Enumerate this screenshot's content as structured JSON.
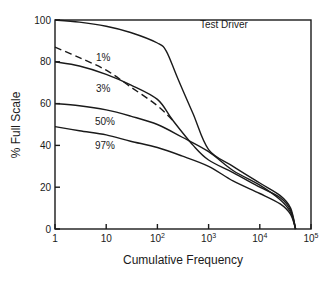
{
  "chart_data": {
    "type": "line",
    "title": "",
    "xlabel": "Cumulative Frequency",
    "ylabel": "% Full Scale",
    "xscale": "log",
    "xlim": [
      1,
      100000
    ],
    "ylim": [
      0,
      100
    ],
    "grid": false,
    "legend": "inline labels",
    "x_ticks": [
      {
        "value": 1,
        "label": "1",
        "sup": ""
      },
      {
        "value": 10,
        "label": "10",
        "sup": ""
      },
      {
        "value": 100,
        "label": "10",
        "sup": "2"
      },
      {
        "value": 1000,
        "label": "10",
        "sup": "3"
      },
      {
        "value": 10000,
        "label": "10",
        "sup": "4"
      },
      {
        "value": 100000,
        "label": "10",
        "sup": "5"
      }
    ],
    "y_ticks": [
      0,
      20,
      40,
      60,
      80,
      100
    ],
    "series": [
      {
        "name": "Test Driver",
        "style": "solid",
        "x": [
          1,
          3,
          10,
          30,
          100,
          150,
          250,
          500,
          1000,
          3000,
          10000,
          25000,
          40000,
          50000
        ],
        "y": [
          100,
          99,
          97,
          94,
          89,
          85,
          72,
          55,
          38,
          30,
          22,
          16,
          10,
          0
        ],
        "label_pos": {
          "x": 200,
          "y": 28
        }
      },
      {
        "name": "1%",
        "style": "dashed",
        "x": [
          1,
          3,
          10,
          30,
          100,
          200
        ],
        "y": [
          87,
          82,
          76,
          68,
          59,
          52
        ],
        "label_pos": {
          "x": 96,
          "y": 61
        }
      },
      {
        "name": "3%",
        "style": "solid",
        "x": [
          1,
          3,
          10,
          30,
          100,
          200,
          500,
          1000,
          3000,
          10000,
          25000,
          40000,
          50000
        ],
        "y": [
          80,
          78,
          74,
          69,
          62,
          52,
          40,
          33,
          27,
          20,
          15,
          9,
          0
        ],
        "label_pos": {
          "x": 96,
          "y": 92
        }
      },
      {
        "name": "50%",
        "style": "solid",
        "x": [
          1,
          3,
          10,
          30,
          100,
          300,
          1000,
          3000,
          10000,
          25000,
          40000,
          50000
        ],
        "y": [
          60,
          59,
          57,
          54,
          50,
          44,
          37,
          28,
          21,
          14,
          8,
          0
        ],
        "label_pos": {
          "x": 95,
          "y": 125
        }
      },
      {
        "name": "97%",
        "style": "solid",
        "x": [
          1,
          3,
          10,
          30,
          100,
          300,
          1000,
          3000,
          10000,
          25000,
          40000,
          50000
        ],
        "y": [
          49,
          47,
          45,
          42,
          39,
          35,
          30,
          23,
          17,
          12,
          7,
          0
        ],
        "label_pos": {
          "x": 95,
          "y": 149
        }
      }
    ]
  }
}
